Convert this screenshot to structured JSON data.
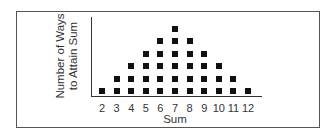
{
  "chart_data": {
    "type": "scatter",
    "subtype": "dot-plot",
    "title": "",
    "xlabel": "Sum",
    "ylabel": "Number of Ways to Attain Sum",
    "ylabel_lines": [
      "Number of Ways",
      "to Attain Sum"
    ],
    "categories": [
      "2",
      "3",
      "4",
      "5",
      "6",
      "7",
      "8",
      "9",
      "10",
      "11",
      "12"
    ],
    "values": [
      1,
      2,
      3,
      4,
      5,
      6,
      5,
      4,
      3,
      2,
      1
    ],
    "marker": "square",
    "marker_color": "#111111",
    "grid": false,
    "legend": null,
    "ylim": [
      0,
      6
    ]
  }
}
